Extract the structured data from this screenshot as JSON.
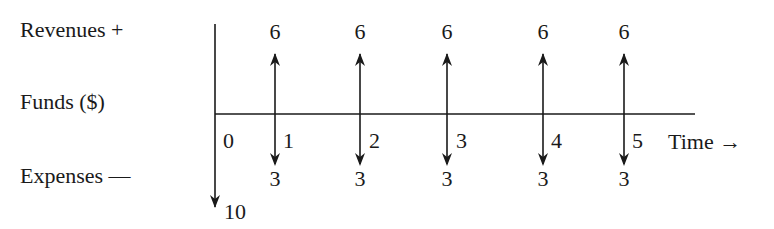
{
  "labels": {
    "revenues": "Revenues +",
    "funds": "Funds ($)",
    "expenses": "Expenses —",
    "time": "Time →"
  },
  "initial": {
    "period": "0",
    "outflow": "10"
  },
  "periods": [
    {
      "period": "1",
      "revenue": "6",
      "expense": "3"
    },
    {
      "period": "2",
      "revenue": "6",
      "expense": "3"
    },
    {
      "period": "3",
      "revenue": "6",
      "expense": "3"
    },
    {
      "period": "4",
      "revenue": "6",
      "expense": "3"
    },
    {
      "period": "5",
      "revenue": "6",
      "expense": "3"
    }
  ],
  "colors": {
    "ink": "#1a1a1a",
    "background": "#ffffff"
  }
}
